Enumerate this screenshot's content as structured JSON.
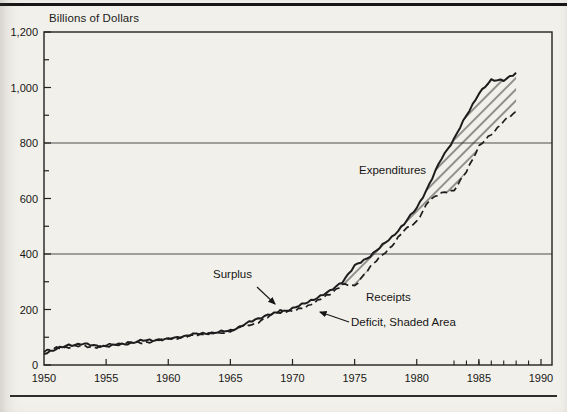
{
  "chart_data": {
    "type": "line",
    "title": "Billions of Dollars",
    "xlabel": "",
    "ylabel": "Billions of Dollars",
    "xlim": [
      1950,
      1990
    ],
    "ylim": [
      0,
      1200
    ],
    "grid_values": [
      400,
      800
    ],
    "x_ticks": {
      "values": [
        1950,
        1955,
        1960,
        1965,
        1970,
        1975,
        1980,
        1985,
        1990
      ],
      "labels": [
        "1950",
        "1955",
        "1960",
        "1965",
        "1970",
        "1975",
        "1980",
        "1985",
        "1990"
      ]
    },
    "x_minor_ticks": [
      1983,
      1984,
      1985,
      1986,
      1987,
      1988,
      1989
    ],
    "y_ticks": {
      "values": [
        0,
        200,
        400,
        600,
        800,
        1000,
        1200
      ],
      "labels": [
        "0",
        "200",
        "400",
        "600",
        "800",
        "1,000",
        "1,200"
      ]
    },
    "y_minor_ticks": [
      100,
      300,
      500,
      700,
      900,
      1100
    ],
    "start_year": 1950,
    "categories": [
      1950,
      1951,
      1952,
      1953,
      1954,
      1955,
      1956,
      1957,
      1958,
      1959,
      1960,
      1961,
      1962,
      1963,
      1964,
      1965,
      1966,
      1967,
      1968,
      1969,
      1970,
      1971,
      1972,
      1973,
      1974,
      1975,
      1976,
      1977,
      1978,
      1979,
      1980,
      1981,
      1982,
      1983,
      1984,
      1985,
      1986,
      1987,
      1988
    ],
    "series": [
      {
        "name": "Expenditures",
        "line": "solid",
        "values": [
          42,
          58,
          71,
          77,
          70,
          68,
          72,
          80,
          88,
          91,
          93,
          102,
          110,
          114,
          118,
          124,
          143,
          163,
          181,
          189,
          205,
          221,
          244,
          265,
          300,
          356,
          385,
          422,
          461,
          509,
          566,
          650,
          745,
          815,
          898,
          980,
          1025,
          1028,
          1050
        ]
      },
      {
        "name": "Receipts",
        "line": "dashed",
        "values": [
          50,
          60,
          65,
          69,
          64,
          71,
          77,
          81,
          79,
          88,
          96,
          99,
          106,
          113,
          113,
          123,
          141,
          149,
          172,
          198,
          192,
          209,
          230,
          256,
          290,
          284,
          340,
          387,
          430,
          485,
          518,
          592,
          622,
          626,
          700,
          786,
          832,
          878,
          912
        ]
      }
    ],
    "deficit_hatch_start_year": 1973,
    "line_color": "#1d1d1d",
    "grid_color": "#4c4c4c",
    "annotations": [
      {
        "id": "expenditures-label",
        "text": "Expenditures"
      },
      {
        "id": "surplus-label",
        "text": "Surplus"
      },
      {
        "id": "receipts-label",
        "text": "Receipts"
      },
      {
        "id": "deficit-label",
        "text": "Deficit, Shaded Area"
      }
    ]
  }
}
